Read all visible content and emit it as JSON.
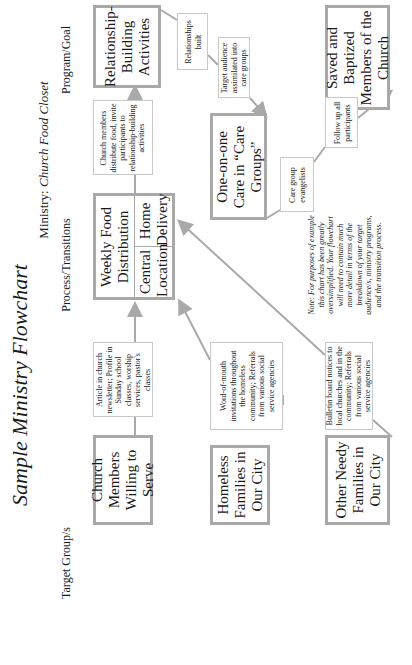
{
  "title": "Sample Ministry Flowchart",
  "ministry": {
    "label": "Ministry:",
    "name": "Church Food Closet"
  },
  "columns": {
    "target": "Target Group/s",
    "process": "Process/Transitions",
    "goal": "Program/Goal"
  },
  "target_groups": [
    {
      "label": "Church Members Willing to Serve"
    },
    {
      "label": "Homeless Families in Our City"
    },
    {
      "label": "Other Needy Families in Our City"
    }
  ],
  "outreach": [
    {
      "text": "Article in church newsletter; Profile in Sunday school classes, worship services, pastor's classes"
    },
    {
      "text": "Word-of-mouth invitations throughout the homeless community; Referrals from various social service agencies"
    },
    {
      "text": "Bulletin board notices to local churches and in the community; Referrals from various social service agencies"
    }
  ],
  "process": {
    "main": "Weekly Food Distribution",
    "central": "Central Location",
    "home": "Home Delivery"
  },
  "transitions": {
    "distribute": "Church members distribute food, invite participants to relationship-building activities",
    "relationships": "Relationships built",
    "assimilated": "Target audience assimilated into care groups",
    "evangelists": "Care group evangelists",
    "follow_up": "Follow up all participants"
  },
  "programs": {
    "relationship": "Relationship-Building Activities",
    "care": "One-on-one Care in “Care Groups”",
    "goal": "Saved and Baptized Members of the Church"
  },
  "note": "Note: For purposes of example this chart has been greatly oversimplified. Your flowchart will need to contain much more detail in terms of the breakdown of your target audience/s, ministry programs, and the transition process.",
  "colors": {
    "border": "#a9a9a9",
    "arrow": "#a9a9a9",
    "text": "#1a1a1a"
  }
}
